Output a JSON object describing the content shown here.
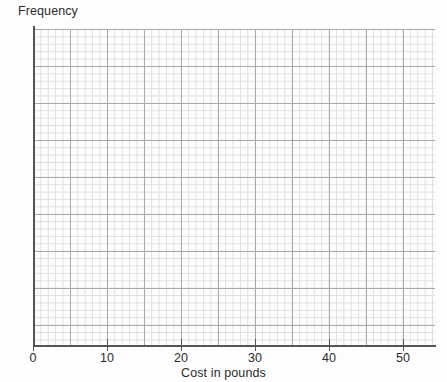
{
  "chart_data": {
    "type": "bar",
    "title": "",
    "xlabel": "Cost in pounds",
    "ylabel": "Frequency",
    "categories": [],
    "values": [],
    "series": [],
    "x_ticks": [
      0,
      10,
      20,
      30,
      40,
      50
    ],
    "x_tick_labels": [
      "0",
      "10",
      "20",
      "30",
      "40",
      "50"
    ],
    "y_ticks": [],
    "y_tick_labels": [],
    "xlim": [
      0,
      54.3
    ],
    "ylim": [
      0,
      42.7
    ],
    "grid": "graph-paper-minor-and-major",
    "legend": "none",
    "note": "Blank graph-paper grid with no plotted data"
  },
  "axes": {
    "y_title": "Frequency",
    "x_title": "Cost in pounds"
  },
  "grid_geometry": {
    "minor_cell_px": 7.4,
    "major_cell_px": 37,
    "units_per_minor_cell": 1,
    "px_per_unit": 7.4
  },
  "colors": {
    "background": "#fdfdfd",
    "minor_grid": "#dedede",
    "major_grid": "#a9a9a9",
    "axis": "#555555",
    "text": "#2b2b2b"
  }
}
